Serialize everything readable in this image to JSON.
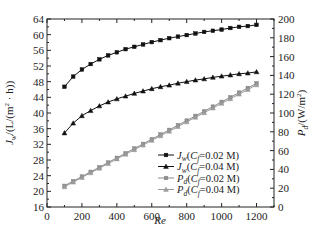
{
  "chart_data": {
    "type": "line",
    "title": "",
    "xlabel": "Re",
    "ylabel_left": "J_w/(L/(m^2 · h))",
    "ylabel_right": "P_d/(W/m^2)",
    "xlim": [
      0,
      1300
    ],
    "ylim_left": [
      16,
      64
    ],
    "ylim_right": [
      0,
      200
    ],
    "x_ticks": [
      0,
      200,
      400,
      600,
      800,
      1000,
      1200
    ],
    "y_ticks_left": [
      16,
      20,
      24,
      28,
      32,
      36,
      40,
      44,
      48,
      52,
      56,
      60,
      64
    ],
    "y_ticks_right": [
      0,
      20,
      40,
      60,
      80,
      100,
      120,
      140,
      160,
      180,
      200
    ],
    "grid": false,
    "legend_position": "bottom-right",
    "x": [
      100,
      150,
      200,
      250,
      300,
      350,
      400,
      450,
      500,
      550,
      600,
      650,
      700,
      750,
      800,
      850,
      900,
      950,
      1000,
      1050,
      1100,
      1150,
      1200
    ],
    "series": [
      {
        "name": "Jw(Cf=0.02 M)",
        "legend": {
          "main": "J",
          "sub": "w",
          "pre": "(C",
          "sub2": "f",
          "post": "=0.02 M)"
        },
        "axis": "left",
        "marker": "square",
        "color": "#111111",
        "values": [
          46.7,
          49.3,
          51.1,
          52.5,
          53.7,
          54.7,
          55.5,
          56.3,
          56.9,
          57.5,
          58.1,
          58.6,
          59.1,
          59.5,
          59.9,
          60.3,
          60.7,
          61.0,
          61.3,
          61.7,
          62.0,
          62.2,
          62.5
        ]
      },
      {
        "name": "Jw(Cf=0.04 M)",
        "legend": {
          "main": "J",
          "sub": "w",
          "pre": "(C",
          "sub2": "f",
          "post": "=0.04 M)"
        },
        "axis": "left",
        "marker": "triangle",
        "color": "#111111",
        "values": [
          34.9,
          37.4,
          39.3,
          40.6,
          41.8,
          42.8,
          43.6,
          44.3,
          45.0,
          45.6,
          46.2,
          46.7,
          47.1,
          47.6,
          48.0,
          48.4,
          48.7,
          49.1,
          49.4,
          49.7,
          50.0,
          50.2,
          50.5
        ]
      },
      {
        "name": "Pd(Cf=0.02 M)",
        "legend": {
          "main": "P",
          "sub": "d",
          "pre": "(C",
          "sub2": "f",
          "post": "=0.02 M)"
        },
        "axis": "right",
        "marker": "square",
        "color": "#8a8a8a",
        "values": [
          22.5,
          27.5,
          32.4,
          37.4,
          42.3,
          47.3,
          52.3,
          57.2,
          62.2,
          67.1,
          72.1,
          77.1,
          82.0,
          87.0,
          91.9,
          96.9,
          101.8,
          106.8,
          111.8,
          116.7,
          121.7,
          126.6,
          131.6
        ]
      },
      {
        "name": "Pd(Cf=0.04 M)",
        "legend": {
          "main": "P",
          "sub": "d",
          "pre": "(C",
          "sub2": "f",
          "post": "=0.04 M)"
        },
        "axis": "right",
        "marker": "triangle",
        "color": "#9a9a9a",
        "values": [
          21.5,
          26.4,
          31.4,
          36.3,
          41.2,
          46.1,
          51.1,
          56.0,
          60.9,
          65.8,
          70.8,
          75.7,
          80.6,
          85.5,
          90.5,
          95.4,
          100.3,
          105.2,
          110.2,
          115.1,
          120.0,
          124.9,
          129.9
        ]
      }
    ]
  }
}
